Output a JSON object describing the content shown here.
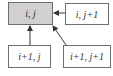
{
  "diagram": {
    "nodes": [
      {
        "id": "cell-i-j",
        "label": "i, j",
        "highlighted": true
      },
      {
        "id": "cell-i-j1",
        "label": "i, j+1",
        "highlighted": false
      },
      {
        "id": "cell-i1-j",
        "label": "i+1, j",
        "highlighted": false
      },
      {
        "id": "cell-i1-j1",
        "label": "i+1, j+1",
        "highlighted": false
      }
    ],
    "edges": [
      {
        "from": "cell-i-j1",
        "to": "cell-i-j"
      },
      {
        "from": "cell-i1-j",
        "to": "cell-i-j"
      },
      {
        "from": "cell-i1-j1",
        "to": "cell-i-j"
      }
    ],
    "colors": {
      "highlight_fill": "#d0d0d0",
      "border": "#6e6e6e",
      "arrow": "#333333"
    }
  }
}
